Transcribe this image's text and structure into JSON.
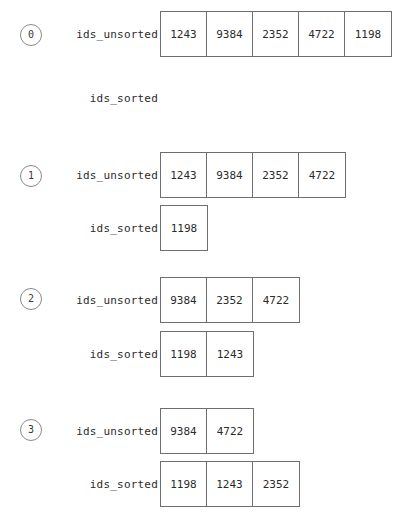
{
  "diagram": {
    "label_unsorted": "ids_unsorted",
    "label_sorted": "ids_sorted",
    "colors": {
      "box_border": "#6e6e6e",
      "badge_border": "#8a8a8a",
      "text": "#2b2b2b",
      "background": "#ffffff"
    },
    "steps": [
      {
        "index": "0",
        "unsorted_label": "ids_unsorted",
        "sorted_label": "ids_sorted",
        "unsorted": [
          "1243",
          "9384",
          "2352",
          "4722",
          "1198"
        ],
        "sorted": []
      },
      {
        "index": "1",
        "unsorted_label": "ids_unsorted",
        "sorted_label": "ids_sorted",
        "unsorted": [
          "1243",
          "9384",
          "2352",
          "4722"
        ],
        "sorted": [
          "1198"
        ]
      },
      {
        "index": "2",
        "unsorted_label": "ids_unsorted",
        "sorted_label": "ids_sorted",
        "unsorted": [
          "9384",
          "2352",
          "4722"
        ],
        "sorted": [
          "1198",
          "1243"
        ]
      },
      {
        "index": "3",
        "unsorted_label": "ids_unsorted",
        "sorted_label": "ids_sorted",
        "unsorted": [
          "9384",
          "4722"
        ],
        "sorted": [
          "1198",
          "1243",
          "2352"
        ]
      }
    ]
  }
}
